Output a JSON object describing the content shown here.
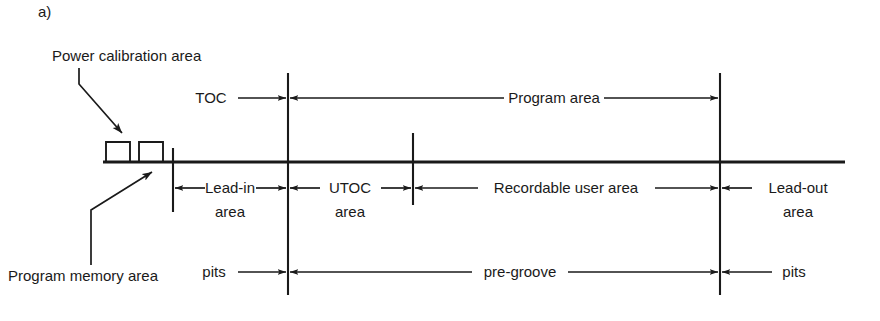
{
  "figure": {
    "caption": "a)",
    "diagram_title": "Recordable disc area layout"
  },
  "callouts": {
    "power_calibration": "Power calibration area",
    "program_memory": "Program memory area"
  },
  "rows": {
    "top": {
      "toc": "TOC",
      "program_area": "Program area"
    },
    "middle": {
      "lead_in_line1": "Lead-in",
      "lead_in_line2": "area",
      "utoc_line1": "UTOC",
      "utoc_line2": "area",
      "recordable_user_area": "Recordable user area",
      "lead_out_line1": "Lead-out",
      "lead_out_line2": "area"
    },
    "bottom": {
      "pits_left": "pits",
      "pre_groove": "pre-groove",
      "pits_right": "pits"
    }
  },
  "colors": {
    "ink": "#1a1a1a",
    "background": "#ffffff"
  },
  "geometry": {
    "baseline_y": 162,
    "baseline_x_start": 103,
    "baseline_x_end": 845,
    "divider_toc_x": 288,
    "divider_utoc_x": 413,
    "divider_leadout_x": 720,
    "divider_leadin_x": 173,
    "pca_box1_x": 106,
    "pca_box2_x": 139,
    "pca_box_width": 24,
    "pca_box_height": 20
  }
}
